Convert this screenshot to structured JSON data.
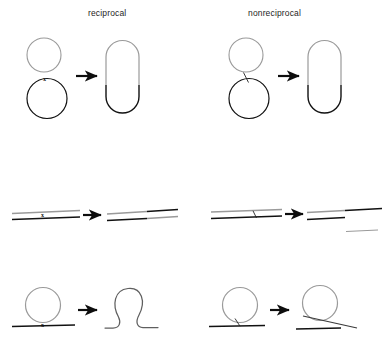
{
  "figure": {
    "title_left": "reciprocal",
    "title_right": "nonreciprocal",
    "crossover_marker": "x",
    "colors": {
      "gray_strand": "#9a9a9a",
      "black_strand": "#111111",
      "arrow": "#0d0d0d",
      "background": "#ffffff",
      "text": "#1d1d1d"
    }
  },
  "columns": [
    {
      "id": "reciprocal",
      "label": "reciprocal",
      "marker": "x",
      "marker_type": "cross"
    },
    {
      "id": "nonreciprocal",
      "label": "nonreciprocal",
      "marker": "",
      "marker_type": "slanted-bridge"
    }
  ],
  "rows": [
    {
      "id": "circle-circle",
      "before": "gray circle above black circle",
      "after": "fused capsule, gray upper arc and black lower arc",
      "after_nonreciprocal": "fused capsule, gray upper arc and black lower arc"
    },
    {
      "id": "linear-linear",
      "before": "gray linear duplex above black linear duplex",
      "after": "two linear duplexes with exchanged gray and black segments",
      "after_nonreciprocal": "gray-to-black duplex, shorter gray duplex, and a detached gray fragment"
    },
    {
      "id": "circle-linear",
      "before": "gray circle resting on a black line",
      "after": "black line with an integrated gray loop forming an omega shape",
      "after_nonreciprocal": "gray circle crossed by a black tangent line above a separate black line"
    }
  ],
  "arrows": [
    {
      "id": "arrow-row1-left"
    },
    {
      "id": "arrow-row1-right"
    },
    {
      "id": "arrow-row2-left"
    },
    {
      "id": "arrow-row2-right"
    },
    {
      "id": "arrow-row3-left"
    },
    {
      "id": "arrow-row3-right"
    }
  ]
}
